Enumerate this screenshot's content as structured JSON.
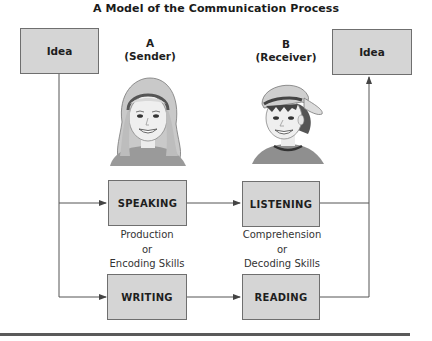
{
  "title": "A Model of the Communication Process",
  "sender": {
    "letter": "A",
    "role": "(Sender)",
    "idea": "Idea"
  },
  "receiver": {
    "letter": "B",
    "role": "(Receiver)",
    "idea": "Idea"
  },
  "boxes": {
    "speaking": "SPEAKING",
    "listening": "LISTENING",
    "writing": "WRITING",
    "reading": "READING"
  },
  "skills": {
    "production": {
      "line1": "Production",
      "line2": "or",
      "line3": "Encoding Skills"
    },
    "comprehension": {
      "line1": "Comprehension",
      "line2": "or",
      "line3": "Decoding Skills"
    }
  },
  "colors": {
    "box_fill": "#d5d5d5",
    "box_border": "#6f6f6f",
    "line": "#555555"
  }
}
